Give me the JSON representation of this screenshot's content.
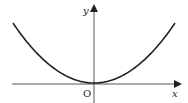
{
  "figure": {
    "type": "function-graph",
    "curve": "y = a*x^2 (shape only)",
    "labels": {
      "x_axis": "x",
      "y_axis": "y",
      "origin": "O"
    },
    "colors": {
      "curve": "#222222",
      "axes": "#333333",
      "background": "#ffffff"
    }
  }
}
